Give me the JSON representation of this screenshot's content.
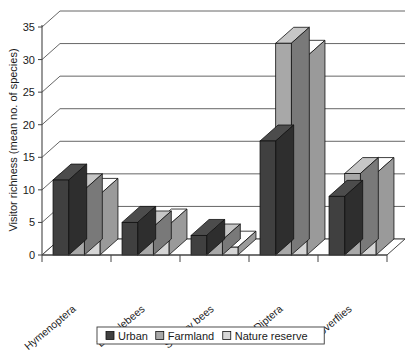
{
  "chart_data": {
    "type": "bar",
    "title": "",
    "xlabel": "",
    "ylabel": "Visitor richness (mean no. of species)",
    "categories": [
      "Hymenoptera",
      "Bumblebees",
      "Solitary bees",
      "Diptera",
      "Hoverflies"
    ],
    "series": [
      {
        "name": "Urban",
        "color": "#404040",
        "values": [
          11.5,
          5.0,
          3.0,
          17.5,
          9.0
        ]
      },
      {
        "name": "Farmland",
        "color": "#a8a8a8",
        "values": [
          10.0,
          4.3,
          2.3,
          32.5,
          12.5
        ]
      },
      {
        "name": "Nature reserve",
        "color": "#d6d6d6",
        "values": [
          9.3,
          4.6,
          1.2,
          30.5,
          12.5
        ]
      }
    ],
    "ylim": [
      0,
      35
    ],
    "yticks": [
      0,
      5,
      10,
      15,
      20,
      25,
      30,
      35
    ],
    "ytick_labels": [
      "0",
      "5",
      "10",
      "15",
      "20",
      "25",
      "30",
      "35"
    ],
    "grid": true,
    "grid_axis": "y",
    "legend_position": "bottom",
    "style": "3d-column",
    "background": "#ffffff"
  }
}
